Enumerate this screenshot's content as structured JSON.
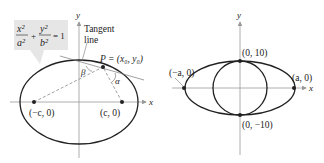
{
  "left_figure": {
    "axis_x_label": "x",
    "axis_y_label": "y",
    "equation": {
      "term1_num": "x²",
      "term1_den": "a²",
      "plus": "+",
      "term2_num": "y²",
      "term2_den": "b²",
      "rhs": "= 1"
    },
    "tangent_label_line1": "Tangent",
    "tangent_label_line2": "line",
    "point_label": "P = (x₀, y₀)",
    "angle_beta": "β",
    "angle_alpha": "α",
    "focus_left_label": "(−c, 0)",
    "focus_right_label": "(c, 0)",
    "box_color": "#e6e6e6"
  },
  "right_figure": {
    "axis_x_label": "x",
    "axis_y_label": "y",
    "top_label": "(0, 10)",
    "bottom_label": "(0, −10)",
    "left_label": "(−a, 0)",
    "right_label": "(a, 0)"
  }
}
